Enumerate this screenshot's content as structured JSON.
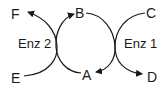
{
  "diagram": {
    "type": "coupled-reaction-cycle",
    "nodes": {
      "A": "A",
      "B": "B",
      "C": "C",
      "D": "D",
      "E": "E",
      "F": "F"
    },
    "enzymes": {
      "left": "Enz 2",
      "right": "Enz 1"
    },
    "edges": [
      {
        "from": "E",
        "to": "F",
        "via": "Enz 2"
      },
      {
        "from": "A",
        "to": "B",
        "via": "Enz 2"
      },
      {
        "from": "C",
        "to": "D",
        "via": "Enz 1"
      },
      {
        "from": "B",
        "to": "A",
        "via": "Enz 1"
      }
    ],
    "stroke_color": "#1a1a1a"
  }
}
